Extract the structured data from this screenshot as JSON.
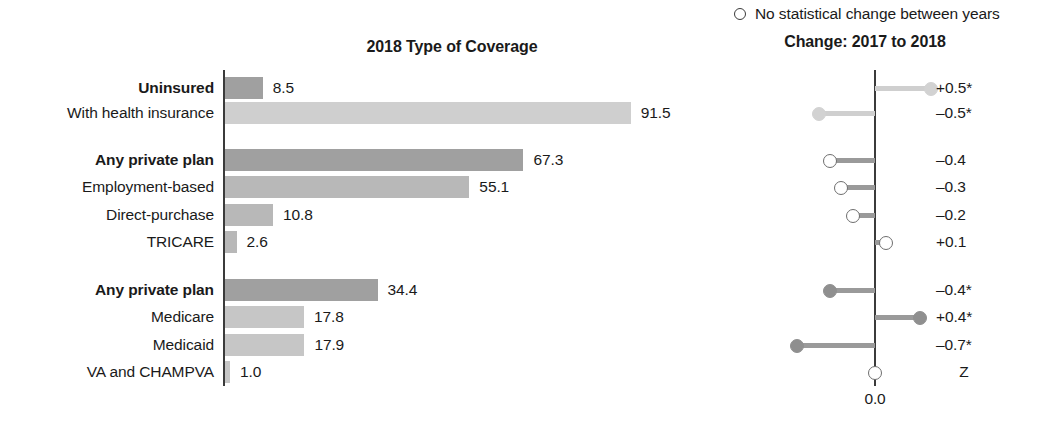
{
  "chart_data": {
    "type": "bar",
    "title": "2018 Type of Coverage",
    "xlabel": "",
    "ylabel": "",
    "xlim": [
      0,
      91.5
    ],
    "grid": false,
    "legend": "O  No statistical change between years",
    "categories": [
      "Uninsured",
      "With health insurance",
      "Any private plan",
      "Employment-based",
      "Direct-purchase",
      "TRICARE",
      "Any private plan",
      "Medicare",
      "Medicaid",
      "VA and CHAMPVA"
    ],
    "values": [
      8.5,
      91.5,
      67.3,
      55.1,
      10.8,
      2.6,
      34.4,
      17.8,
      17.9,
      1.0
    ],
    "secondary_panel": {
      "type": "dot",
      "title": "Change: 2017 to 2018",
      "axis_label": "0.0",
      "categories": [
        "Uninsured",
        "With health insurance",
        "Any private plan",
        "Employment-based",
        "Direct-purchase",
        "TRICARE",
        "Any private plan",
        "Medicare",
        "Medicaid",
        "VA and CHAMPVA",
        "Z"
      ],
      "values": [
        0.5,
        -0.5,
        -0.4,
        -0.3,
        -0.2,
        0.1,
        -0.4,
        0.4,
        -0.7,
        0.0,
        null
      ],
      "labels": [
        "+0.5*",
        "-0.5*",
        "–0.4",
        "–0.3",
        "–0.2",
        "+0.1",
        "–0.4*",
        "+0.4*",
        "–0.7*",
        "Z",
        null
      ],
      "significant": [
        true,
        true,
        false,
        false,
        false,
        false,
        true,
        true,
        true,
        false,
        null
      ]
    }
  },
  "bar_chart": {
    "title": "2018 Type of Coverage",
    "rows": [
      {
        "label": "Uninsured",
        "bold": true,
        "value": 8.5,
        "value_text": "8.5",
        "shade": "dark",
        "top": 76
      },
      {
        "label": "With health insurance",
        "bold": false,
        "value": 91.5,
        "value_text": "91.5",
        "shade": "light",
        "top": 101
      },
      {
        "label": "Any private plan",
        "bold": true,
        "value": 67.3,
        "value_text": "67.3",
        "shade": "dark",
        "top": 148
      },
      {
        "label": "Employment-based",
        "bold": false,
        "value": 55.1,
        "value_text": "55.1",
        "shade": "mid",
        "top": 175
      },
      {
        "label": "Direct-purchase",
        "bold": false,
        "value": 10.8,
        "value_text": "10.8",
        "shade": "mid",
        "top": 203
      },
      {
        "label": "TRICARE",
        "bold": false,
        "value": 2.6,
        "value_text": "2.6",
        "shade": "mid",
        "top": 230
      },
      {
        "label": "Any private plan",
        "bold": true,
        "value": 34.4,
        "value_text": "34.4",
        "shade": "dark",
        "top": 278
      },
      {
        "label": "Medicare",
        "bold": false,
        "value": 17.8,
        "value_text": "17.8",
        "shade": "light2",
        "top": 305
      },
      {
        "label": "Medicaid",
        "bold": false,
        "value": 17.9,
        "value_text": "17.9",
        "shade": "light2",
        "top": 333
      },
      {
        "label": "VA and CHAMPVA",
        "bold": false,
        "value": 1.0,
        "value_text": "1.0",
        "shade": "light2",
        "top": 360
      }
    ]
  },
  "change_panel": {
    "legend_text": "No statistical change between years",
    "legend_icon": "hollow-circle-icon",
    "title": "Change: 2017 to 2018",
    "zero_label": "0.0",
    "rows": [
      {
        "value": 0.5,
        "text": "+0.5*",
        "style": "filled-light",
        "top": 76
      },
      {
        "value": -0.5,
        "text": "–0.5*",
        "style": "filled-light",
        "top": 101
      },
      {
        "value": -0.4,
        "text": "–0.4",
        "style": "hollow",
        "top": 148
      },
      {
        "value": -0.3,
        "text": "–0.3",
        "style": "hollow",
        "top": 175
      },
      {
        "value": -0.2,
        "text": "–0.2",
        "style": "hollow",
        "top": 203
      },
      {
        "value": 0.1,
        "text": "+0.1",
        "style": "hollow",
        "top": 230
      },
      {
        "value": -0.4,
        "text": "–0.4*",
        "style": "filled-dark",
        "top": 278
      },
      {
        "value": 0.4,
        "text": "+0.4*",
        "style": "filled-dark",
        "top": 305
      },
      {
        "value": -0.7,
        "text": "–0.7*",
        "style": "filled-dark",
        "top": 333
      },
      {
        "value": 0.0,
        "text": "Z",
        "style": "hollow",
        "top": 360,
        "centered": true
      }
    ]
  }
}
